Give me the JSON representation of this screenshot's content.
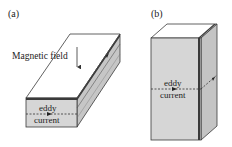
{
  "figure": {
    "panels": [
      {
        "id": "a",
        "label": "(a)",
        "magnetic_field_label": "Magnetic field",
        "eddy_label_line1": "eddy",
        "eddy_label_line2": "current"
      },
      {
        "id": "b",
        "label": "(b)",
        "eddy_label_line1": "eddy",
        "eddy_label_line2": "current"
      }
    ],
    "colors": {
      "face_front": "#d4d4d4",
      "face_side": "#c2c2c2",
      "face_top": "#ffffff",
      "stroke": "#3a3a3a",
      "dark_strip": "#555555"
    }
  }
}
